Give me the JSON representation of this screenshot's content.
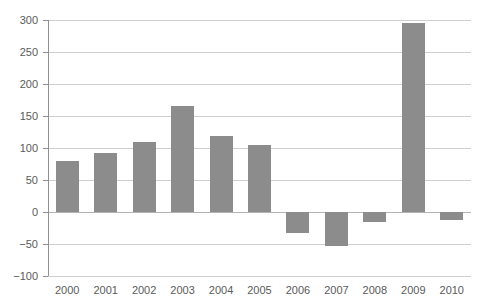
{
  "chart_data": {
    "type": "bar",
    "title": "",
    "subtitle": "",
    "xlabel": "",
    "ylabel": "",
    "categories": [
      "2000",
      "2001",
      "2002",
      "2003",
      "2004",
      "2005",
      "2006",
      "2007",
      "2008",
      "2009",
      "2010"
    ],
    "values": [
      80,
      92,
      110,
      165,
      118,
      105,
      -33,
      -53,
      -15,
      296,
      -12
    ],
    "series": [
      {
        "name": "value",
        "values": [
          80,
          92,
          110,
          165,
          118,
          105,
          -33,
          -53,
          -15,
          296,
          -12
        ]
      }
    ],
    "ylim": [
      -100,
      300
    ],
    "yticks": [
      -100,
      -50,
      0,
      50,
      100,
      150,
      200,
      250,
      300
    ],
    "ytick_labels": [
      "−100",
      "−50",
      "0",
      "50",
      "100",
      "150",
      "200",
      "250",
      "300"
    ],
    "grid": true,
    "legend": false,
    "legend_position": "none",
    "bar_color": "#8c8c8c",
    "gridline_color": "#cfcfcf",
    "axis_color": "#909090",
    "zero_line_color": "#b4b4b4",
    "tick_label_color": "#5a5a5a",
    "background_color": "#ffffff"
  }
}
